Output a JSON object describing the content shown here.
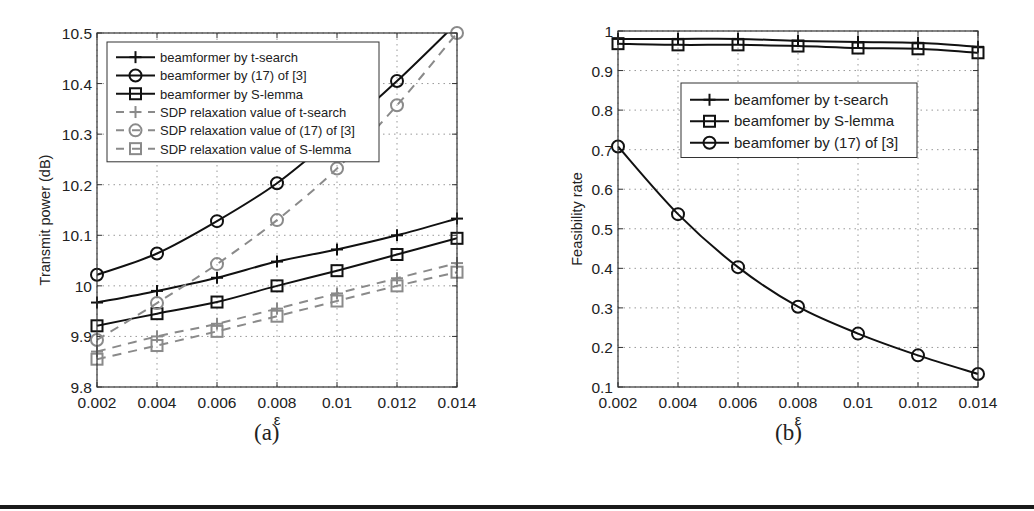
{
  "figure": {
    "captions": {
      "a": "(a)",
      "b": "(b)"
    }
  },
  "chart_data": [
    {
      "id": "a",
      "type": "line",
      "title": "",
      "xlabel": "ε",
      "ylabel": "Transmit power (dB)",
      "x": [
        0.002,
        0.004,
        0.006,
        0.008,
        0.01,
        0.012,
        0.014
      ],
      "xticks": [
        "0.002",
        "0.004",
        "0.006",
        "0.008",
        "0.01",
        "0.012",
        "0.014"
      ],
      "yticks": [
        "9.8",
        "9.9",
        "10",
        "10.1",
        "10.2",
        "10.3",
        "10.4",
        "10.5"
      ],
      "xlim": [
        0.002,
        0.014
      ],
      "ylim": [
        9.8,
        10.5
      ],
      "grid": true,
      "legend_position": "upper left",
      "series": [
        {
          "name": "beamformer by t-search",
          "marker": "plus",
          "style": "solid",
          "color": "#111111",
          "values": [
            9.967,
            9.99,
            10.016,
            10.048,
            10.072,
            10.1,
            10.133
          ]
        },
        {
          "name": "beamformer by (17) of [3]",
          "marker": "circle",
          "style": "solid",
          "color": "#111111",
          "values": [
            10.022,
            10.064,
            10.128,
            10.203,
            10.3,
            10.405,
            10.52
          ]
        },
        {
          "name": "beamformer by S-lemma",
          "marker": "square",
          "style": "solid",
          "color": "#111111",
          "values": [
            9.921,
            9.945,
            9.968,
            10.0,
            10.03,
            10.062,
            10.094
          ]
        },
        {
          "name": "SDP relaxation value of t-search",
          "marker": "plus",
          "style": "dashed",
          "color": "#8a8a8a",
          "values": [
            9.87,
            9.9,
            9.925,
            9.955,
            9.985,
            10.015,
            10.045
          ]
        },
        {
          "name": "SDP relaxation value of (17) of [3]",
          "marker": "circle",
          "style": "dashed",
          "color": "#8a8a8a",
          "values": [
            9.893,
            9.966,
            10.043,
            10.13,
            10.232,
            10.357,
            10.5
          ]
        },
        {
          "name": "SDP relaxation value of S-lemma",
          "marker": "square",
          "style": "dashed",
          "color": "#8a8a8a",
          "values": [
            9.855,
            9.882,
            9.91,
            9.94,
            9.97,
            10.0,
            10.027
          ]
        }
      ]
    },
    {
      "id": "b",
      "type": "line",
      "title": "",
      "xlabel": "ε",
      "ylabel": "Feasibility rate",
      "x": [
        0.002,
        0.004,
        0.006,
        0.008,
        0.01,
        0.012,
        0.014
      ],
      "xticks": [
        "0.002",
        "0.004",
        "0.006",
        "0.008",
        "0.01",
        "0.012",
        "0.014"
      ],
      "yticks": [
        "0.1",
        "0.2",
        "0.3",
        "0.4",
        "0.5",
        "0.6",
        "0.7",
        "0.8",
        "0.9",
        "1"
      ],
      "xlim": [
        0.002,
        0.014
      ],
      "ylim": [
        0.1,
        1.0
      ],
      "grid": true,
      "legend_position": "upper right",
      "series": [
        {
          "name": "beamfomer by t-search",
          "marker": "plus",
          "style": "solid",
          "color": "#111111",
          "values": [
            0.98,
            0.98,
            0.98,
            0.975,
            0.972,
            0.97,
            0.96
          ]
        },
        {
          "name": "beamfomer by S-lemma",
          "marker": "square",
          "style": "solid",
          "color": "#111111",
          "values": [
            0.968,
            0.965,
            0.965,
            0.962,
            0.957,
            0.955,
            0.945
          ]
        },
        {
          "name": "beamfomer by (17) of [3]",
          "marker": "circle",
          "style": "solid",
          "color": "#111111",
          "values": [
            0.708,
            0.537,
            0.403,
            0.303,
            0.235,
            0.18,
            0.133
          ]
        }
      ]
    }
  ]
}
